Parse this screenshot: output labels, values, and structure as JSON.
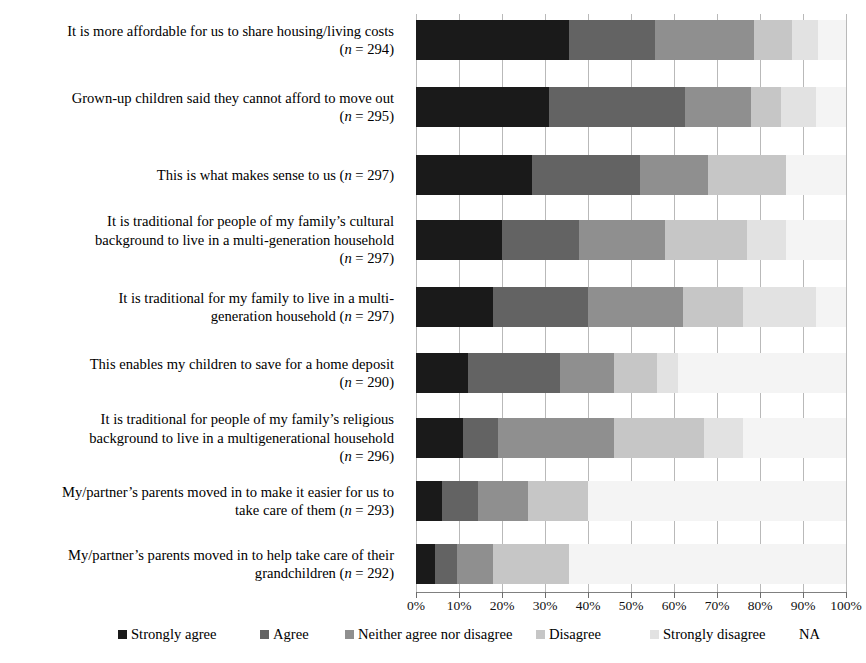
{
  "chart_data": {
    "type": "bar",
    "orientation": "horizontal",
    "stacked": true,
    "stacked_percent": true,
    "title": "",
    "subtitle": "",
    "xlabel": "",
    "ylabel": "",
    "xlim": [
      0,
      100
    ],
    "xtick_labels": [
      "0%",
      "10%",
      "20%",
      "30%",
      "40%",
      "50%",
      "60%",
      "70%",
      "80%",
      "90%",
      "100%"
    ],
    "xticks": [
      0,
      10,
      20,
      30,
      40,
      50,
      60,
      70,
      80,
      90,
      100
    ],
    "grid": true,
    "legend_position": "bottom",
    "legend": [
      "Strongly agree",
      "Agree",
      "Neither agree nor disagree",
      "Disagree",
      "Strongly disagree",
      "NA"
    ],
    "series_colors": [
      "#1a1a1a",
      "#636363",
      "#8f8f8f",
      "#c6c6c6",
      "#e2e2e2",
      "#f4f4f4"
    ],
    "categories": [
      "It is more affordable for us to share housing/living costs (n = 294)",
      "Grown-up children said they cannot afford to move out (n = 295)",
      "This is what makes sense to us (n = 297)",
      "It is traditional for people of my family’s cultural background to live in a multi-generation household (n = 297)",
      "It is traditional for my family to live in a multi-generation household (n = 297)",
      "This enables my children to save for a home deposit (n = 290)",
      "It is traditional for people of my family’s religious background to live in a multigenerational household (n = 296)",
      "My/partner’s parents moved in to make it easier for us to take care of them (n = 293)",
      "My/partner’s parents moved in to help take care of their grandchildren (n = 292)"
    ],
    "series": [
      {
        "name": "Strongly agree",
        "values": [
          35.5,
          31.0,
          27.0,
          20.0,
          18.0,
          12.0,
          11.0,
          6.0,
          4.5
        ]
      },
      {
        "name": "Agree",
        "values": [
          20.0,
          31.5,
          25.0,
          18.0,
          22.0,
          21.5,
          8.0,
          8.5,
          5.0
        ]
      },
      {
        "name": "Neither agree nor disagree",
        "values": [
          23.0,
          15.5,
          16.0,
          20.0,
          22.0,
          12.5,
          27.0,
          11.5,
          8.5
        ]
      },
      {
        "name": "Disagree",
        "values": [
          9.0,
          7.0,
          18.0,
          19.0,
          14.0,
          10.0,
          21.0,
          14.0,
          17.5
        ]
      },
      {
        "name": "Strongly disagree",
        "values": [
          6.0,
          8.0,
          0.0,
          9.0,
          17.0,
          5.0,
          9.0,
          0.0,
          0.0
        ]
      },
      {
        "name": "NA",
        "values": [
          6.5,
          7.0,
          14.0,
          14.0,
          7.0,
          39.0,
          24.0,
          60.0,
          64.5
        ]
      }
    ],
    "rows": [
      {
        "label_lines": [
          "It is more affordable for us to share housing/living costs",
          "(n = 294)"
        ],
        "n": 294,
        "values": [
          35.5,
          20.0,
          23.0,
          9.0,
          6.0,
          6.5
        ]
      },
      {
        "label_lines": [
          "Grown-up children said they cannot afford to move out",
          "(n = 295)"
        ],
        "n": 295,
        "values": [
          31.0,
          31.5,
          15.5,
          7.0,
          8.0,
          7.0
        ]
      },
      {
        "label_lines": [
          "This is what makes sense to us (n = 297)"
        ],
        "n": 297,
        "values": [
          27.0,
          25.0,
          16.0,
          18.0,
          0.0,
          14.0
        ]
      },
      {
        "label_lines": [
          "It is traditional for people of my family’s cultural",
          "background to live in a multi-generation household",
          "(n = 297)"
        ],
        "n": 297,
        "values": [
          20.0,
          18.0,
          20.0,
          19.0,
          9.0,
          14.0
        ]
      },
      {
        "label_lines": [
          "It is traditional for my family to live in a multi-",
          "generation household (n = 297)"
        ],
        "n": 297,
        "values": [
          18.0,
          22.0,
          22.0,
          14.0,
          17.0,
          7.0
        ]
      },
      {
        "label_lines": [
          "This enables my children to save for a home deposit",
          "(n = 290)"
        ],
        "n": 290,
        "values": [
          12.0,
          21.5,
          12.5,
          10.0,
          5.0,
          39.0
        ]
      },
      {
        "label_lines": [
          "It is traditional for people of my family’s religious",
          "background to live in a multigenerational household",
          "(n = 296)"
        ],
        "n": 296,
        "values": [
          11.0,
          8.0,
          27.0,
          21.0,
          9.0,
          24.0
        ]
      },
      {
        "label_lines": [
          "My/partner’s parents moved in to make it easier for us to",
          "take care of them (n = 293)"
        ],
        "n": 293,
        "values": [
          6.0,
          8.5,
          11.5,
          14.0,
          0.0,
          60.0
        ]
      },
      {
        "label_lines": [
          "My/partner’s parents moved in to help take care of their",
          "grandchildren (n = 292)"
        ],
        "n": 292,
        "values": [
          4.5,
          5.0,
          8.5,
          17.5,
          0.0,
          64.5
        ]
      }
    ]
  }
}
